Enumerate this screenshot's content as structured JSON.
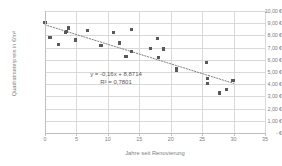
{
  "chart_data": {
    "type": "scatter",
    "title": "",
    "xlabel": "Jahre seit Renovierung",
    "ylabel": "Quadratmeterpreis in €/m²",
    "xlim": [
      0,
      35
    ],
    "ylim": [
      0,
      10
    ],
    "grid": true,
    "legend": "none",
    "xticks": [
      0,
      5,
      10,
      15,
      20,
      25,
      30,
      35
    ],
    "xtick_labels": [
      "0",
      "5",
      "10",
      "15",
      "20",
      "25",
      "30",
      "35"
    ],
    "yticks": [
      0,
      1,
      2,
      3,
      4,
      5,
      6,
      7,
      8,
      9,
      10
    ],
    "ytick_labels": [
      "-   €",
      "1,00 €",
      "2,00 €",
      "3,00 €",
      "4,00 €",
      "5,00 €",
      "6,00 €",
      "7,00 €",
      "8,00 €",
      "9,00 €",
      "10,00 €"
    ],
    "marker_color": "#58595b",
    "gridline_color": "#d9d9d9",
    "axis_color": "#bfbfbf",
    "text_color": "#808080",
    "points": [
      {
        "x": 0.0,
        "y": 9.05
      },
      {
        "x": 0.8,
        "y": 7.85
      },
      {
        "x": 2.1,
        "y": 7.28
      },
      {
        "x": 3.2,
        "y": 8.22
      },
      {
        "x": 3.4,
        "y": 8.32
      },
      {
        "x": 3.8,
        "y": 8.6
      },
      {
        "x": 4.9,
        "y": 7.62
      },
      {
        "x": 6.7,
        "y": 8.38
      },
      {
        "x": 8.9,
        "y": 7.2
      },
      {
        "x": 10.9,
        "y": 8.27
      },
      {
        "x": 11.9,
        "y": 7.38
      },
      {
        "x": 12.9,
        "y": 6.26
      },
      {
        "x": 13.7,
        "y": 8.48
      },
      {
        "x": 13.8,
        "y": 6.7
      },
      {
        "x": 16.8,
        "y": 6.92
      },
      {
        "x": 17.9,
        "y": 7.72
      },
      {
        "x": 18.0,
        "y": 6.16
      },
      {
        "x": 18.9,
        "y": 6.88
      },
      {
        "x": 20.9,
        "y": 5.28
      },
      {
        "x": 20.9,
        "y": 5.12
      },
      {
        "x": 25.7,
        "y": 5.78
      },
      {
        "x": 25.8,
        "y": 4.48
      },
      {
        "x": 25.8,
        "y": 4.05
      },
      {
        "x": 27.8,
        "y": 3.28
      },
      {
        "x": 28.9,
        "y": 3.58
      },
      {
        "x": 29.8,
        "y": 4.3
      },
      {
        "x": 29.9,
        "y": 4.32
      }
    ],
    "trendline": {
      "style": "dotted",
      "color": "#808080",
      "slope": -0.16,
      "intercept": 8.8714,
      "x_start": 0,
      "x_end": 30
    },
    "annotations": {
      "equation": "y = -0,16x + 8,8714",
      "r_squared": "R² = 0,7801"
    }
  }
}
